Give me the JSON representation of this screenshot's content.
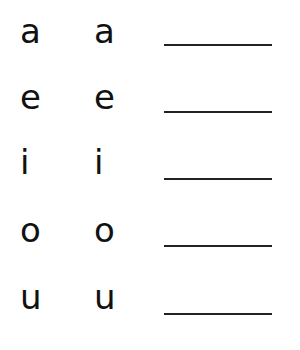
{
  "worksheet": {
    "rows": [
      {
        "letter_1": "a",
        "letter_2": "a",
        "answer": ""
      },
      {
        "letter_1": "e",
        "letter_2": "e",
        "answer": ""
      },
      {
        "letter_1": "i",
        "letter_2": "i",
        "answer": ""
      },
      {
        "letter_1": "o",
        "letter_2": "o",
        "answer": ""
      },
      {
        "letter_1": "u",
        "letter_2": "u",
        "answer": ""
      }
    ]
  }
}
